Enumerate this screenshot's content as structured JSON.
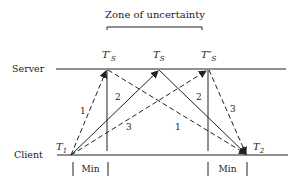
{
  "diagram": {
    "title": "Zone of uncertainty",
    "rows": {
      "server": "Server",
      "client": "Client"
    },
    "server_times": {
      "left": "T′",
      "middle": "T",
      "right": "T″",
      "subscript": "S"
    },
    "client_times": {
      "t1": "T",
      "t1_sub": "1",
      "t2": "T",
      "t2_sub": "2"
    },
    "min_labels": [
      "Min",
      "Min"
    ],
    "message_labels": {
      "up1": "1",
      "up2": "2",
      "up3": "3",
      "down1": "1",
      "down2": "2",
      "down3": "3"
    },
    "colors": {
      "line": "#222222",
      "background": "#ffffff"
    }
  }
}
